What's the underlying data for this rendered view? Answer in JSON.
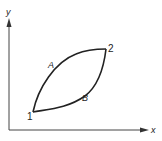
{
  "diagram": {
    "type": "x-y process path diagram",
    "axes": {
      "x_label": "x",
      "y_label": "y"
    },
    "points": [
      {
        "id": "1",
        "label": "1"
      },
      {
        "id": "2",
        "label": "2"
      }
    ],
    "paths": [
      {
        "id": "A",
        "label": "A",
        "from": "1",
        "to": "2",
        "position": "upper"
      },
      {
        "id": "B",
        "label": "B",
        "from": "1",
        "to": "2",
        "position": "lower"
      }
    ],
    "colors": {
      "line": "#222222",
      "background": "#ffffff"
    }
  }
}
